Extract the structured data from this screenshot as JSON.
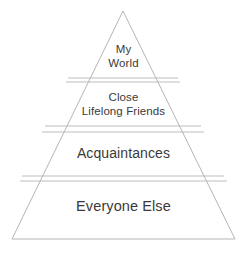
{
  "diagram": {
    "type": "pyramid",
    "background_color": "#ffffff",
    "stroke_color": "#b5b5b5",
    "text_color": "#3a3a3a",
    "apex": {
      "x": 123,
      "y": 11
    },
    "base_left": {
      "x": 12,
      "y": 239
    },
    "base_right": {
      "x": 235,
      "y": 239
    },
    "dividers": [
      {
        "y_top": 78,
        "y_bottom": 82
      },
      {
        "y_top": 126,
        "y_bottom": 132
      },
      {
        "y_top": 176,
        "y_bottom": 181
      }
    ],
    "tiers": [
      {
        "index": 0,
        "name": "my-world",
        "label": "My\nWorld",
        "label_lines": [
          "My",
          "World"
        ],
        "position": "top"
      },
      {
        "index": 1,
        "name": "close-lifelong-friends",
        "label": "Close\nLifelong Friends",
        "label_lines": [
          "Close",
          "Lifelong Friends"
        ],
        "position": "second"
      },
      {
        "index": 2,
        "name": "acquaintances",
        "label": "Acquaintances",
        "label_lines": [
          "Acquaintances"
        ],
        "position": "third"
      },
      {
        "index": 3,
        "name": "everyone-else",
        "label": "Everyone Else",
        "label_lines": [
          "Everyone Else"
        ],
        "position": "base"
      }
    ]
  }
}
